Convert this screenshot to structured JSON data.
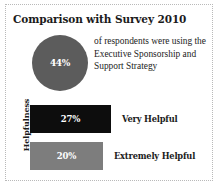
{
  "panel": {
    "title": "Comparison with Survey 2010",
    "border_color": "#b9b9b9",
    "background": "#ffffff"
  },
  "stat": {
    "value_label": "44%",
    "circle_color": "#5c5c5c",
    "description": "of respondents were using the Executive Sponsorship and Support Strategy"
  },
  "bar_chart": {
    "axis_label": "Helpfulness",
    "bars": [
      {
        "value_label": "27%",
        "category": "Very Helpful",
        "color": "#0d0d0d",
        "width_px": 81,
        "label_left_px": 92
      },
      {
        "value_label": "20%",
        "category": "Extremely Helpful",
        "color": "#7d7d7d",
        "width_px": 73,
        "label_left_px": 84
      }
    ]
  },
  "chart_data": {
    "type": "bar",
    "title": "Comparison with Survey 2010",
    "xlabel": "",
    "ylabel": "Helpfulness",
    "categories": [
      "Very Helpful",
      "Extremely Helpful"
    ],
    "values": [
      27,
      20
    ],
    "value_labels": [
      "27%",
      "20%"
    ],
    "units": "percent",
    "orientation": "horizontal",
    "grid": false,
    "legend": "none",
    "series": [
      {
        "name": "Helpfulness",
        "values": [
          27,
          20
        ],
        "colors": [
          "#0d0d0d",
          "#7d7d7d"
        ]
      }
    ],
    "annotations": [
      {
        "type": "circle-stat",
        "value": 44,
        "label": "44%",
        "text": "of respondents were using the Executive Sponsorship and Support Strategy"
      }
    ]
  }
}
